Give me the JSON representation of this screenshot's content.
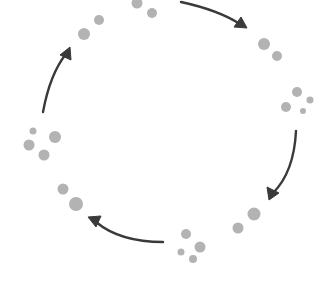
{
  "diagram": {
    "type": "cycle",
    "direction": "clockwise",
    "canvas": {
      "width": 317,
      "height": 281,
      "background": "#ffffff"
    },
    "colors": {
      "dot": "#b3b3b3",
      "arrow": "#3a3a3a"
    },
    "clusters": [
      {
        "id": "top",
        "dots": [
          {
            "x": 137,
            "y": 3,
            "r": 5.5
          },
          {
            "x": 152,
            "y": 13,
            "r": 5
          }
        ]
      },
      {
        "id": "top-right",
        "dots": [
          {
            "x": 264,
            "y": 44,
            "r": 6
          },
          {
            "x": 277,
            "y": 56,
            "r": 5
          }
        ]
      },
      {
        "id": "right",
        "dots": [
          {
            "x": 297,
            "y": 92,
            "r": 5
          },
          {
            "x": 310,
            "y": 100,
            "r": 3.5
          },
          {
            "x": 286,
            "y": 107,
            "r": 5
          },
          {
            "x": 303,
            "y": 111,
            "r": 3
          }
        ]
      },
      {
        "id": "bottom-right",
        "dots": [
          {
            "x": 254,
            "y": 214,
            "r": 6.5
          },
          {
            "x": 238,
            "y": 228,
            "r": 5.5
          }
        ]
      },
      {
        "id": "bottom",
        "dots": [
          {
            "x": 186,
            "y": 234,
            "r": 5
          },
          {
            "x": 200,
            "y": 247,
            "r": 5.5
          },
          {
            "x": 181,
            "y": 252,
            "r": 3.5
          },
          {
            "x": 193,
            "y": 259,
            "r": 4
          }
        ]
      },
      {
        "id": "bottom-left",
        "dots": [
          {
            "x": 63,
            "y": 189,
            "r": 5.5
          },
          {
            "x": 76,
            "y": 204,
            "r": 7
          }
        ]
      },
      {
        "id": "left",
        "dots": [
          {
            "x": 33,
            "y": 131,
            "r": 3.5
          },
          {
            "x": 55,
            "y": 137,
            "r": 6
          },
          {
            "x": 29,
            "y": 145,
            "r": 5.5
          },
          {
            "x": 44,
            "y": 155,
            "r": 5.5
          }
        ]
      },
      {
        "id": "top-left",
        "dots": [
          {
            "x": 99,
            "y": 20,
            "r": 5
          },
          {
            "x": 84,
            "y": 34,
            "r": 6
          }
        ]
      }
    ],
    "arrows": [
      {
        "id": "arrow-top",
        "path": "M181,2 Q218,10 240,24",
        "head": "247,28 234,27 241,17"
      },
      {
        "id": "arrow-right",
        "path": "M296,131 Q294,172 273,193",
        "head": "269,200 267,187 279,193"
      },
      {
        "id": "arrow-bottom",
        "path": "M163,242 Q120,242 96,222",
        "head": "88,217 101,216 96,227"
      },
      {
        "id": "arrow-left",
        "path": "M43,112 Q50,74 66,54",
        "head": "70,47 71,60 60,55"
      }
    ]
  }
}
